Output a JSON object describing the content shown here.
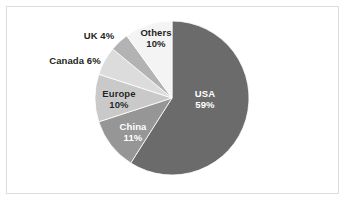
{
  "figure": {
    "background_color": "#ffffff",
    "border_color": "#dcdcdc"
  },
  "chart_data": {
    "type": "pie",
    "title": "",
    "subtitle": "",
    "xlabel": "",
    "ylabel": "",
    "grid": false,
    "legend_position": "none",
    "label_mode": "name-and-percent",
    "start_angle_clock": "12 o'clock",
    "direction": "clockwise",
    "total_percent": 100,
    "categories": [
      "USA",
      "China",
      "Europe",
      "Canada",
      "UK",
      "Others"
    ],
    "values": [
      59,
      11,
      10,
      6,
      4,
      10
    ],
    "slices": [
      {
        "name": "USA",
        "percent": 59,
        "label_name": "USA",
        "label_value": "59%",
        "color": "#6b6b6b",
        "label_color": "#ffffff",
        "label_placement": "inside"
      },
      {
        "name": "China",
        "percent": 11,
        "label_name": "China",
        "label_value": "11%",
        "color": "#969696",
        "label_color": "#ffffff",
        "label_placement": "inside"
      },
      {
        "name": "Europe",
        "percent": 10,
        "label_name": "Europe",
        "label_value": "10%",
        "color": "#c9c9c9",
        "label_color": "#231f20",
        "label_placement": "inside"
      },
      {
        "name": "Canada",
        "percent": 6,
        "label_name": "Canada",
        "label_value": "6%",
        "color": "#dcdcdc",
        "label_color": "#231f20",
        "label_placement": "outside"
      },
      {
        "name": "UK",
        "percent": 4,
        "label_name": "UK",
        "label_value": "4%",
        "color": "#b3b3b3",
        "label_color": "#231f20",
        "label_placement": "outside"
      },
      {
        "name": "Others",
        "percent": 10,
        "label_name": "Others",
        "label_value": "10%",
        "color": "#f4f4f4",
        "label_color": "#231f20",
        "label_placement": "outside"
      }
    ]
  }
}
